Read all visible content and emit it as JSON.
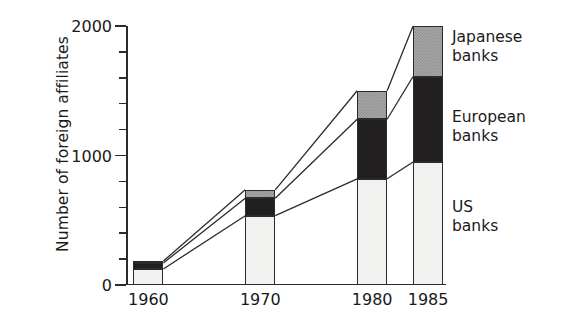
{
  "chart_data": {
    "type": "bar",
    "subtype": "stacked-bar",
    "title": "",
    "xlabel": "",
    "ylabel": "Number of foreign affiliates",
    "categories": [
      "1960",
      "1970",
      "1980",
      "1985"
    ],
    "x_positions": [
      1960,
      1970,
      1980,
      1985
    ],
    "ylim": [
      0,
      2000
    ],
    "y_major_ticks": [
      0,
      1000,
      2000
    ],
    "y_major_tick_labels": [
      "0",
      "1000",
      "2000"
    ],
    "y_minor_ticks": [
      200,
      400,
      600,
      800,
      1200,
      1400,
      1600,
      1800
    ],
    "grid": false,
    "legend_position": "right-outside",
    "series": [
      {
        "name": "US banks",
        "legend_label_line1": "US",
        "legend_label_line2": "banks",
        "fill": "#f1f1ef",
        "pattern": "solid-light",
        "values": [
          124,
          535,
          820,
          950
        ]
      },
      {
        "name": "European banks",
        "legend_label_line1": "European",
        "legend_label_line2": "banks",
        "fill": "#211f1f",
        "pattern": "solid-dark",
        "values": [
          46,
          135,
          460,
          660
        ]
      },
      {
        "name": "Japanese banks",
        "legend_label_line1": "Japanese",
        "legend_label_line2": "banks",
        "fill": "#a8a8a8",
        "pattern": "checker-gray",
        "values": [
          15,
          65,
          220,
          390
        ]
      }
    ],
    "totals": [
      185,
      735,
      1500,
      2000
    ],
    "annotations": [
      "Connector lines join the tops of matching segments across adjacent bars"
    ]
  },
  "axes": {
    "y_title": "Number of foreign affiliates",
    "y_labels": [
      "2000",
      "1000",
      "0"
    ],
    "x_labels": [
      "1960",
      "1970",
      "1980",
      "1985"
    ]
  },
  "legend": {
    "japanese": {
      "line1": "Japanese",
      "line2": "banks"
    },
    "european": {
      "line1": "European",
      "line2": "banks"
    },
    "us": {
      "line1": "US",
      "line2": "banks"
    }
  },
  "colors": {
    "us_banks": "#f1f1ef",
    "european_banks": "#211f1f",
    "japanese_banks": "#a8a8a8",
    "axis": "#2b2b2b",
    "text": "#1a1a1a",
    "background": "#ffffff"
  }
}
